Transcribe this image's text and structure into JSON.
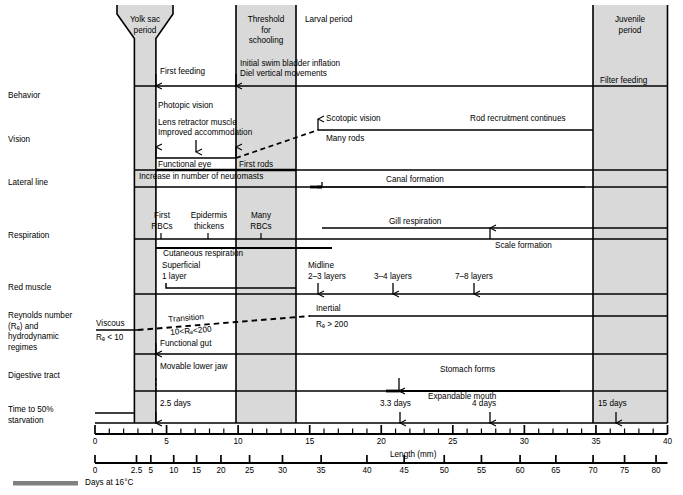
{
  "figure": {
    "title_hidden": "",
    "axes": {
      "length": {
        "label": "Length (mm)",
        "ticks_major": [
          0,
          5,
          10,
          15,
          20,
          25,
          30,
          35,
          40
        ],
        "tick_step_minor": 1,
        "min": 0,
        "max": 40
      },
      "days": {
        "label": "Days at 16°C",
        "ticks": [
          0,
          2.5,
          5,
          10,
          15,
          20,
          25,
          30,
          35,
          40,
          45,
          50,
          55,
          60,
          65,
          70,
          75,
          80
        ],
        "tick_positions_mm": [
          0,
          2.9,
          3.9,
          5.5,
          7.1,
          8.8,
          10.8,
          13.1,
          15.8,
          19.0,
          21.6,
          24.4,
          27.0,
          29.7,
          32.2,
          34.8,
          37.0,
          39.2
        ]
      }
    },
    "bands": [
      {
        "name": "yolk-sac-period",
        "label": "Yolk sac\nperiod",
        "start_mm": 2.75,
        "end_mm": 4.25,
        "shaded": true
      },
      {
        "name": "threshold-for-schooling",
        "label": "Threshold\nfor\nschooling",
        "start_mm": 9.9,
        "end_mm": 14.1,
        "shaded": true
      },
      {
        "name": "larval-period",
        "label": "Larval period",
        "start_mm": 14.1,
        "end_mm": 34.8,
        "shaded": false
      },
      {
        "name": "juvenile-period",
        "label": "Juvenile\nperiod",
        "start_mm": 34.8,
        "end_mm": 40.0,
        "shaded": true
      }
    ],
    "rows": [
      {
        "name": "behavior",
        "label": "Behavior"
      },
      {
        "name": "vision",
        "label": "Vision"
      },
      {
        "name": "lateral-line",
        "label": "Lateral line"
      },
      {
        "name": "respiration",
        "label": "Respiration"
      },
      {
        "name": "red-muscle",
        "label": "Red muscle"
      },
      {
        "name": "reynolds",
        "label": "Reynolds number\n(Rₑ) and\nhydrodynamic\nregimes"
      },
      {
        "name": "digestive-tract",
        "label": "Digestive tract"
      },
      {
        "name": "starvation",
        "label": "Time to 50%\nstarvation"
      }
    ],
    "annotations": {
      "first_feeding": "First feeding",
      "initial_swim_bladder": "Initial swim bladder inflation",
      "diel_vertical": "Diel vertical movements",
      "filter_feeding": "Filter feeding",
      "photopic_vision": "Photopic vision",
      "lens_retractor": "Lens retractor muscle",
      "improved_accommodation": "Improved accommodation",
      "functional_eye": "Functional eye",
      "first_rods": "First rods",
      "scotopic_vision": "Scotopic vision",
      "many_rods": "Many rods",
      "rod_recruitment": "Rod recruitment continues",
      "neuromasts": "Increase in number of neuromasts",
      "canal_formation": "Canal formation",
      "first_rbcs": "First\nRBCs",
      "epidermis_thickens": "Epidermis\nthickens",
      "many_rbcs": "Many\nRBCs",
      "gill_respiration": "Gill respiration",
      "cutaneous_respiration": "Cutaneous respiration",
      "scale_formation": "Scale formation",
      "superficial_1_layer": "Superficial\n1 layer",
      "midline_2_3": "Midline\n2–3 layers",
      "layers_3_4": "3–4 layers",
      "layers_7_8": "7–8 layers",
      "viscous": "Viscous",
      "viscous_re": "Rₑ < 10",
      "transition": "Transition",
      "transition_re": "10<Rₑ<200",
      "inertial": "Inertial",
      "inertial_re": "Rₑ > 200",
      "functional_gut": "Functional gut",
      "stomach_forms": "Stomach forms",
      "movable_lower_jaw": "Movable lower jaw",
      "expandable_mouth": "Expandable mouth",
      "days_2_5": "2.5 days",
      "days_3_3": "3.3 days",
      "days_4": "4 days",
      "days_15": "15 days"
    }
  },
  "chart_data": {
    "type": "table",
    "xlabel": "Length (mm)",
    "ylabel": "Developmental system",
    "xlim": [
      0,
      40
    ],
    "grid": false,
    "legend_position": "none",
    "x_secondary_label": "Days at 16°C",
    "categories": [
      "Behavior",
      "Vision",
      "Lateral line",
      "Respiration",
      "Red muscle",
      "Reynolds number (Rₑ) and hydrodynamic regimes",
      "Digestive tract",
      "Time to 50% starvation"
    ],
    "events": [
      {
        "row": "Behavior",
        "text": "First feeding",
        "x_mm": 4.2,
        "marker": "arrow-down"
      },
      {
        "row": "Behavior",
        "text": "Initial swim bladder inflation",
        "x_mm": 10.0,
        "marker": "arrow-down"
      },
      {
        "row": "Behavior",
        "text": "Diel vertical movements",
        "x_mm": 10.0,
        "marker": "arrow-down"
      },
      {
        "row": "Behavior",
        "text": "Filter feeding",
        "x_mm": 37.4,
        "marker": "none"
      },
      {
        "row": "Vision",
        "text": "Functional eye",
        "x_mm": 4.2,
        "marker": "arrow-up"
      },
      {
        "row": "Vision",
        "text": "Photopic vision",
        "x_mm": 4.4,
        "marker": "span",
        "span_mm": [
          4.2,
          10.0
        ]
      },
      {
        "row": "Vision",
        "text": "Lens retractor muscle / Improved accommodation",
        "x_mm": 7.2,
        "marker": "arrow-down"
      },
      {
        "row": "Vision",
        "text": "First rods",
        "x_mm": 10.0,
        "marker": "arrow-up"
      },
      {
        "row": "Vision",
        "text": "Many rods",
        "x_mm": 15.4,
        "marker": "arrow-up"
      },
      {
        "row": "Vision",
        "text": "Scotopic vision",
        "x_mm": 16.5,
        "marker": "span",
        "span_mm": [
          15.4,
          35.0
        ]
      },
      {
        "row": "Vision",
        "text": "Rod recruitment continues",
        "x_mm": 27.0,
        "marker": "none"
      },
      {
        "row": "Lateral line",
        "text": "Increase in number of neuromasts",
        "x_mm": 9.0,
        "marker": "span",
        "span_mm": [
          4.2,
          14.1
        ]
      },
      {
        "row": "Lateral line",
        "text": "Canal formation",
        "x_mm": 21.0,
        "marker": "arrow-down",
        "span_mm": [
          15.5,
          34.3
        ]
      },
      {
        "row": "Respiration",
        "text": "First RBCs",
        "x_mm": 4.6,
        "marker": "tick"
      },
      {
        "row": "Respiration",
        "text": "Epidermis thickens",
        "x_mm": 7.9,
        "marker": "tick"
      },
      {
        "row": "Respiration",
        "text": "Many RBCs",
        "x_mm": 11.6,
        "marker": "tick"
      },
      {
        "row": "Respiration",
        "text": "Cutaneous respiration",
        "x_mm": 7.9,
        "marker": "span",
        "span_mm": [
          4.2,
          16.5
        ]
      },
      {
        "row": "Respiration",
        "text": "Gill respiration",
        "x_mm": 22.0,
        "marker": "span",
        "span_mm": [
          16.0,
          40.0
        ]
      },
      {
        "row": "Respiration",
        "text": "Scale formation",
        "x_mm": 27.6,
        "marker": "arrow-up"
      },
      {
        "row": "Red muscle",
        "text": "Superficial 1 layer",
        "x_mm": 5.9,
        "marker": "span",
        "span_mm": [
          4.9,
          14.1
        ]
      },
      {
        "row": "Red muscle",
        "text": "Midline 2–3 layers",
        "x_mm": 15.5,
        "marker": "arrow-down"
      },
      {
        "row": "Red muscle",
        "text": "3–4 layers",
        "x_mm": 20.8,
        "marker": "arrow-down"
      },
      {
        "row": "Red muscle",
        "text": "7–8 layers",
        "x_mm": 26.5,
        "marker": "arrow-down"
      },
      {
        "row": "Reynolds number (Rₑ) and hydrodynamic regimes",
        "text": "Viscous Rₑ < 10",
        "x_mm": 1.4,
        "marker": "solid",
        "span_mm": [
          0.0,
          3.0
        ]
      },
      {
        "row": "Reynolds number (Rₑ) and hydrodynamic regimes",
        "text": "Transition 10<Rₑ<200",
        "x_mm": 7.5,
        "marker": "dashed",
        "span_mm": [
          3.0,
          15.0
        ]
      },
      {
        "row": "Reynolds number (Rₑ) and hydrodynamic regimes",
        "text": "Inertial Rₑ > 200",
        "x_mm": 17.0,
        "marker": "solid",
        "span_mm": [
          15.0,
          40.0
        ]
      },
      {
        "row": "Digestive tract",
        "text": "Functional gut",
        "x_mm": 4.2,
        "marker": "arrow-down"
      },
      {
        "row": "Digestive tract",
        "text": "Stomach forms",
        "x_mm": 23.5,
        "marker": "arrow-down"
      },
      {
        "row": "Digestive tract",
        "text": "Expandable mouth",
        "x_mm": 23.5,
        "marker": "span",
        "span_mm": [
          21.5,
          32.5
        ]
      },
      {
        "row": "Digestive tract",
        "text": "Movable lower jaw",
        "x_mm": 4.2,
        "marker": "arrow-down"
      },
      {
        "row": "Time to 50% starvation",
        "text": "2.5 days",
        "x_mm": 4.2,
        "marker": "arrow-down"
      },
      {
        "row": "Time to 50% starvation",
        "text": "3.3 days",
        "x_mm": 21.3,
        "marker": "arrow-down"
      },
      {
        "row": "Time to 50% starvation",
        "text": "4 days",
        "x_mm": 27.6,
        "marker": "arrow-down"
      },
      {
        "row": "Time to 50% starvation",
        "text": "15 days",
        "x_mm": 36.4,
        "marker": "arrow-down"
      }
    ]
  },
  "colors": {
    "band_shade": "#d9d9d9",
    "line": "#000000",
    "footer_bar": "#808080",
    "background": "#ffffff"
  }
}
